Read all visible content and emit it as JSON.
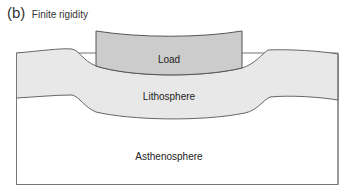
{
  "figure": {
    "panel_label": "(b)",
    "title": "Finite rigidity"
  },
  "layers": {
    "load": {
      "label": "Load",
      "fill": "#cccccc"
    },
    "lithosphere": {
      "label": "Lithosphere",
      "fill": "#e8e8e8"
    },
    "asthenosphere": {
      "label": "Asthenosphere",
      "fill": "#ffffff"
    }
  },
  "colors": {
    "outline": "#666666"
  }
}
